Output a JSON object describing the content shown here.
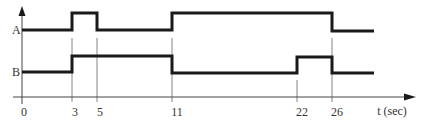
{
  "diagram": {
    "type": "timing-diagram",
    "x_axis": {
      "label": "t (sec)",
      "ticks": [
        "0",
        "3",
        "5",
        "11",
        "22",
        "26"
      ]
    },
    "signals": [
      {
        "name": "A",
        "transitions": [
          {
            "t": 0,
            "level": "low"
          },
          {
            "t": 3,
            "level": "high"
          },
          {
            "t": 5,
            "level": "low"
          },
          {
            "t": 11,
            "level": "high"
          },
          {
            "t": 26,
            "level": "low"
          }
        ]
      },
      {
        "name": "B",
        "transitions": [
          {
            "t": 0,
            "level": "low"
          },
          {
            "t": 3,
            "level": "high"
          },
          {
            "t": 11,
            "level": "low"
          },
          {
            "t": 22,
            "level": "high"
          },
          {
            "t": 26,
            "level": "low"
          }
        ]
      }
    ],
    "colors": {
      "signal": "#1a1a1a",
      "axis": "#444444",
      "guide": "#666666",
      "text": "#333333"
    }
  }
}
